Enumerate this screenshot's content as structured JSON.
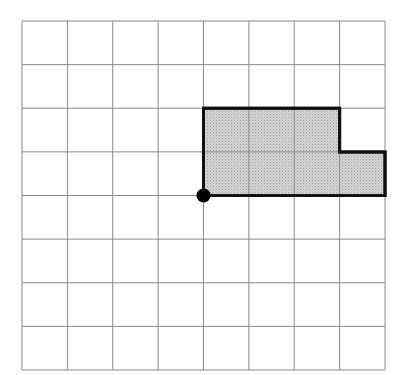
{
  "diagram": {
    "type": "grid-polygon",
    "grid": {
      "columns": 8,
      "rows": 8,
      "left": 22,
      "top": 21,
      "right": 385,
      "bottom": 370,
      "line_color": "#8a8a8a"
    },
    "shape": {
      "description": "L-shaped shaded region on grid",
      "vertices_grid": [
        [
          4,
          4
        ],
        [
          4,
          2
        ],
        [
          7,
          2
        ],
        [
          7,
          3
        ],
        [
          8,
          3
        ],
        [
          8,
          4
        ]
      ],
      "fill": "#c8c8c8",
      "stroke": "#111111",
      "stroke_width": 3,
      "area_squares": 7
    },
    "point": {
      "grid": [
        4,
        4
      ],
      "color": "#000000",
      "radius": 7
    }
  }
}
